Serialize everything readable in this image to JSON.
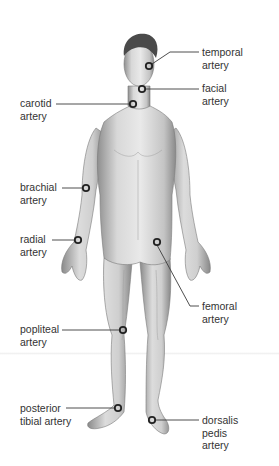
{
  "diagram": {
    "colors": {
      "marker": "#2a2a2a",
      "leader_line": "#3a3a3a",
      "text": "#333333",
      "skin_mid": "#c9c9c9",
      "hair": "#4a4a4a"
    },
    "labels": [
      {
        "id": "temporal",
        "lines": [
          "temporal",
          "artery"
        ],
        "side": "right",
        "text_x": 202,
        "text_y": 47,
        "point": [
          149,
          66
        ]
      },
      {
        "id": "facial",
        "lines": [
          "facial",
          "artery"
        ],
        "side": "right",
        "text_x": 202,
        "text_y": 83,
        "point": [
          142,
          89
        ]
      },
      {
        "id": "carotid",
        "lines": [
          "carotid",
          "artery"
        ],
        "side": "left",
        "text_x": 20,
        "text_y": 97,
        "point": [
          133,
          104
        ]
      },
      {
        "id": "brachial",
        "lines": [
          "brachial",
          "artery"
        ],
        "side": "left",
        "text_x": 20,
        "text_y": 181,
        "point": [
          86,
          188
        ]
      },
      {
        "id": "radial",
        "lines": [
          "radial",
          "artery"
        ],
        "side": "left",
        "text_x": 20,
        "text_y": 234,
        "point": [
          78,
          240
        ]
      },
      {
        "id": "femoral",
        "lines": [
          "femoral",
          "artery"
        ],
        "side": "right",
        "text_x": 202,
        "text_y": 300,
        "point": [
          157,
          242
        ]
      },
      {
        "id": "popliteal",
        "lines": [
          "popliteal",
          "artery"
        ],
        "side": "left",
        "text_x": 20,
        "text_y": 323,
        "point": [
          123,
          330
        ]
      },
      {
        "id": "posterior-tibial",
        "lines": [
          "posterior",
          "tibial artery"
        ],
        "side": "left",
        "text_x": 20,
        "text_y": 403,
        "point": [
          118,
          408
        ]
      },
      {
        "id": "dorsalis-pedis",
        "lines": [
          "dorsalis",
          "pedis",
          "artery"
        ],
        "side": "right",
        "text_x": 202,
        "text_y": 414,
        "point": [
          152,
          420
        ]
      }
    ]
  }
}
